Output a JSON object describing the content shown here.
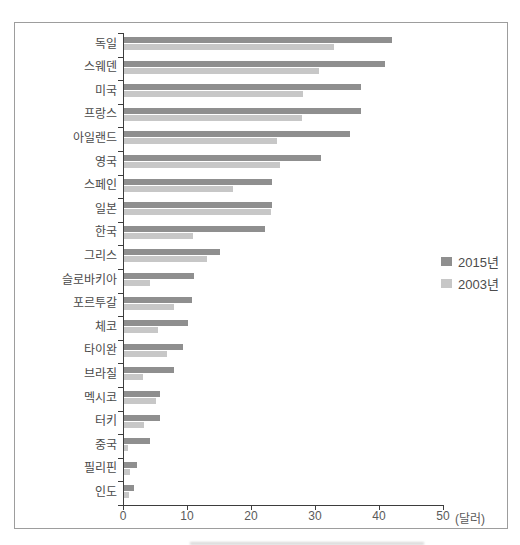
{
  "chart_data": {
    "type": "bar",
    "orientation": "horizontal",
    "title": "",
    "xlabel": "",
    "ylabel": "",
    "unit_label": "(달러)",
    "x_ticks": [
      0,
      10,
      20,
      30,
      40,
      50
    ],
    "xlim": [
      0,
      50
    ],
    "grid": false,
    "legend_position": "right",
    "categories": [
      "독일",
      "스웨덴",
      "미국",
      "프랑스",
      "아일랜드",
      "영국",
      "스페인",
      "일본",
      "한국",
      "그리스",
      "슬로바키아",
      "포르투갈",
      "체코",
      "타이완",
      "브라질",
      "멕시코",
      "터키",
      "중국",
      "필리핀",
      "인도"
    ],
    "series": [
      {
        "name": "2015년",
        "color": "#8f8f8f",
        "values": [
          41.8,
          40.8,
          37.0,
          37.0,
          35.3,
          30.8,
          23.2,
          23.2,
          22.0,
          15.0,
          10.9,
          10.7,
          10.0,
          9.2,
          7.8,
          5.6,
          5.7,
          4.0,
          2.0,
          1.5
        ]
      },
      {
        "name": "2003년",
        "color": "#c7c7c7",
        "values": [
          32.8,
          30.4,
          27.9,
          27.8,
          23.9,
          24.4,
          17.0,
          22.9,
          10.8,
          13.0,
          4.1,
          7.8,
          5.3,
          6.7,
          3.0,
          5.0,
          3.2,
          0.6,
          1.0,
          0.8
        ]
      }
    ],
    "axis_color": "#3d3d3d",
    "frame_border_color": "#9d9d9d"
  }
}
